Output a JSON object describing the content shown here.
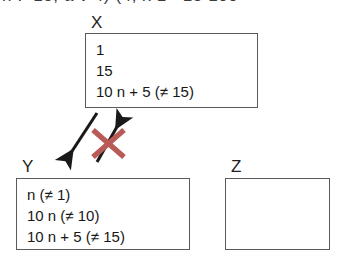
{
  "figure": {
    "top_cropped_text": "n !=15;  a v  4)  (4,  x 1= 15 100",
    "background_color": "#ffffff",
    "line_color": "#5a5a5a",
    "text_color": "#171717",
    "cross_color": "#b85a55",
    "arrow_color": "#1a1a1a"
  },
  "sets": [
    {
      "id": "x",
      "label": "X",
      "lines": [
        "1",
        "15",
        "10 n + 5 (≠ 15)"
      ],
      "empty": false
    },
    {
      "id": "y",
      "label": "Y",
      "lines": [
        "n (≠ 1)",
        "10 n (≠ 10)",
        "10 n + 5 (≠ 15)"
      ],
      "empty": false
    },
    {
      "id": "z",
      "label": "Z",
      "lines": [],
      "empty": true
    }
  ],
  "annotations": {
    "arrow_down_left": {
      "name": "arrow-down-left",
      "from": [
        97,
        113
      ],
      "to": [
        68,
        157
      ]
    },
    "arrow_up_right": {
      "name": "arrow-up-right",
      "from": [
        97,
        162
      ],
      "to": [
        120,
        121
      ]
    },
    "cross_mark": {
      "name": "red-cross-mark",
      "meaning": "crossed out / not allowed",
      "color": "#b85a55"
    }
  }
}
